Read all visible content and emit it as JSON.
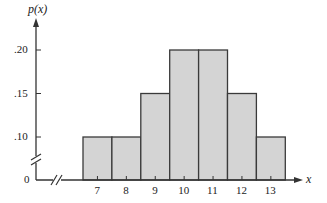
{
  "chart_data": {
    "type": "bar",
    "title": "",
    "xlabel": "x",
    "ylabel": "p(x)",
    "categories": [
      "7",
      "8",
      "9",
      "10",
      "11",
      "12",
      "13"
    ],
    "values": [
      0.1,
      0.1,
      0.15,
      0.2,
      0.2,
      0.15,
      0.1
    ],
    "y_ticks": [
      ".10",
      ".15",
      ".20"
    ],
    "y_zero_label": "0",
    "ylim": [
      0,
      0.22
    ],
    "axis_break": true,
    "grid": false,
    "legend": null,
    "bar_color": "#d4d4d4",
    "edge_color": "#3a3a3a"
  }
}
